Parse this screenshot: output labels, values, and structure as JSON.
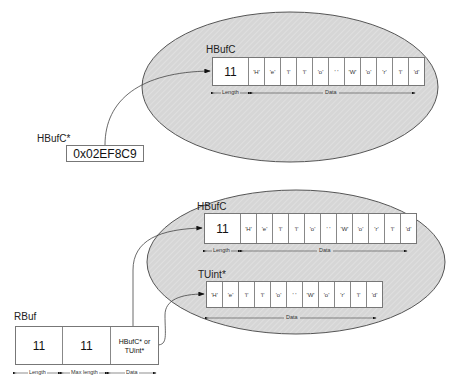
{
  "top": {
    "heap_label": "HBufC",
    "length_value": "11",
    "chars": [
      "'H'",
      "'e'",
      "'l'",
      "'l'",
      "'o'",
      "' '",
      "'W'",
      "'o'",
      "'r'",
      "'l'",
      "'d'"
    ],
    "length_caption": "Length",
    "data_caption": "Data",
    "pointer_label": "HBufC*",
    "pointer_value": "0x02EF8C9"
  },
  "bottom": {
    "hbufc_label": "HBufC",
    "hbufc_length_value": "11",
    "hbufc_chars": [
      "'H'",
      "'e'",
      "'l'",
      "'l'",
      "'o'",
      "' '",
      "'W'",
      "'o'",
      "'r'",
      "'l'",
      "'d'"
    ],
    "hbufc_length_caption": "Length",
    "hbufc_data_caption": "Data",
    "tuint_label": "TUint*",
    "tuint_chars": [
      "'H'",
      "'e'",
      "'l'",
      "'l'",
      "'o'",
      "' '",
      "'W'",
      "'o'",
      "'r'",
      "'l'",
      "'d'"
    ],
    "tuint_data_caption": "Data"
  },
  "rbuf": {
    "label": "RBuf",
    "length_value": "11",
    "max_length_value": "11",
    "data_line1": "HBufC* or",
    "data_line2": "TUint*",
    "length_caption": "Length",
    "max_length_caption": "Max length",
    "data_caption": "Data"
  },
  "colors": {
    "ellipse_fill": "#d9d9d9",
    "outline": "#555555",
    "box_fill": "#ffffff"
  }
}
